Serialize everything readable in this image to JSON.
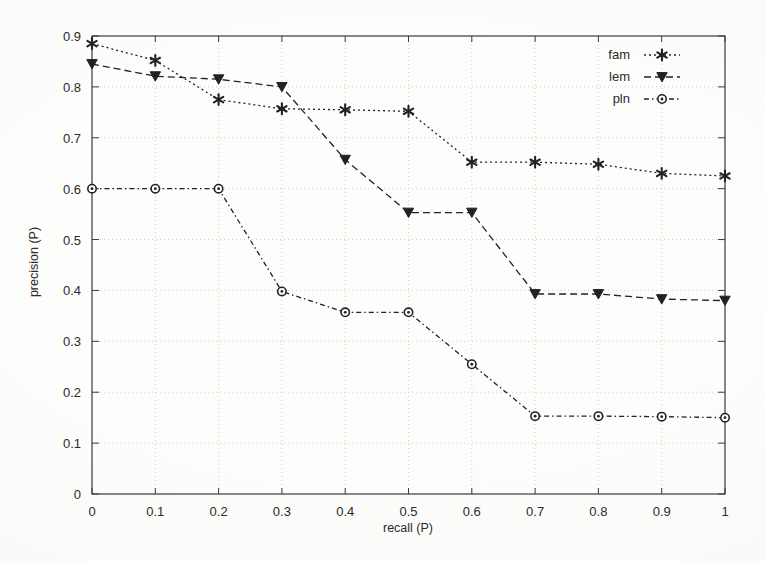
{
  "chart_data": {
    "type": "line",
    "title": "",
    "xlabel": "recall (P)",
    "ylabel": "precision (P)",
    "xlim": [
      0,
      1
    ],
    "ylim": [
      0,
      0.9
    ],
    "xticks": [
      "0",
      "0.1",
      "0.2",
      "0.3",
      "0.4",
      "0.5",
      "0.6",
      "0.7",
      "0.8",
      "0.9",
      "1"
    ],
    "xtick_values": [
      0,
      0.1,
      0.2,
      0.3,
      0.4,
      0.5,
      0.6,
      0.7,
      0.8,
      0.9,
      1
    ],
    "yticks": [
      "0",
      "0.1",
      "0.2",
      "0.3",
      "0.4",
      "0.5",
      "0.6",
      "0.7",
      "0.8",
      "0.9"
    ],
    "ytick_values": [
      0,
      0.1,
      0.2,
      0.3,
      0.4,
      0.5,
      0.6,
      0.7,
      0.8,
      0.9
    ],
    "grid": true,
    "legend_position": "top-right-inside",
    "x": [
      0,
      0.1,
      0.2,
      0.3,
      0.4,
      0.5,
      0.6,
      0.7,
      0.8,
      0.9,
      1
    ],
    "series": [
      {
        "name": "fam",
        "marker": "star",
        "linestyle": "dotted",
        "color": "#222222",
        "values": [
          0.885,
          0.852,
          0.775,
          0.757,
          0.755,
          0.752,
          0.652,
          0.652,
          0.648,
          0.63,
          0.625
        ]
      },
      {
        "name": "lem",
        "marker": "triangle-down",
        "linestyle": "dashed",
        "color": "#222222",
        "values": [
          0.845,
          0.821,
          0.815,
          0.8,
          0.657,
          0.553,
          0.553,
          0.393,
          0.393,
          0.383,
          0.38
        ]
      },
      {
        "name": "pln",
        "marker": "circle",
        "linestyle": "dashdot",
        "color": "#222222",
        "values": [
          0.6,
          0.6,
          0.6,
          0.398,
          0.357,
          0.357,
          0.255,
          0.153,
          0.153,
          0.152,
          0.15
        ]
      }
    ]
  },
  "legend": {
    "entries": [
      {
        "label": "fam"
      },
      {
        "label": "lem"
      },
      {
        "label": "pln"
      }
    ]
  },
  "axes": {
    "x_title": "recall (P)",
    "y_title": "precision (P)"
  },
  "colors": {
    "ink": "#222222",
    "grid": "#c9c9c2",
    "frame": "#3a3a3a",
    "background": "#fdfdfc"
  }
}
